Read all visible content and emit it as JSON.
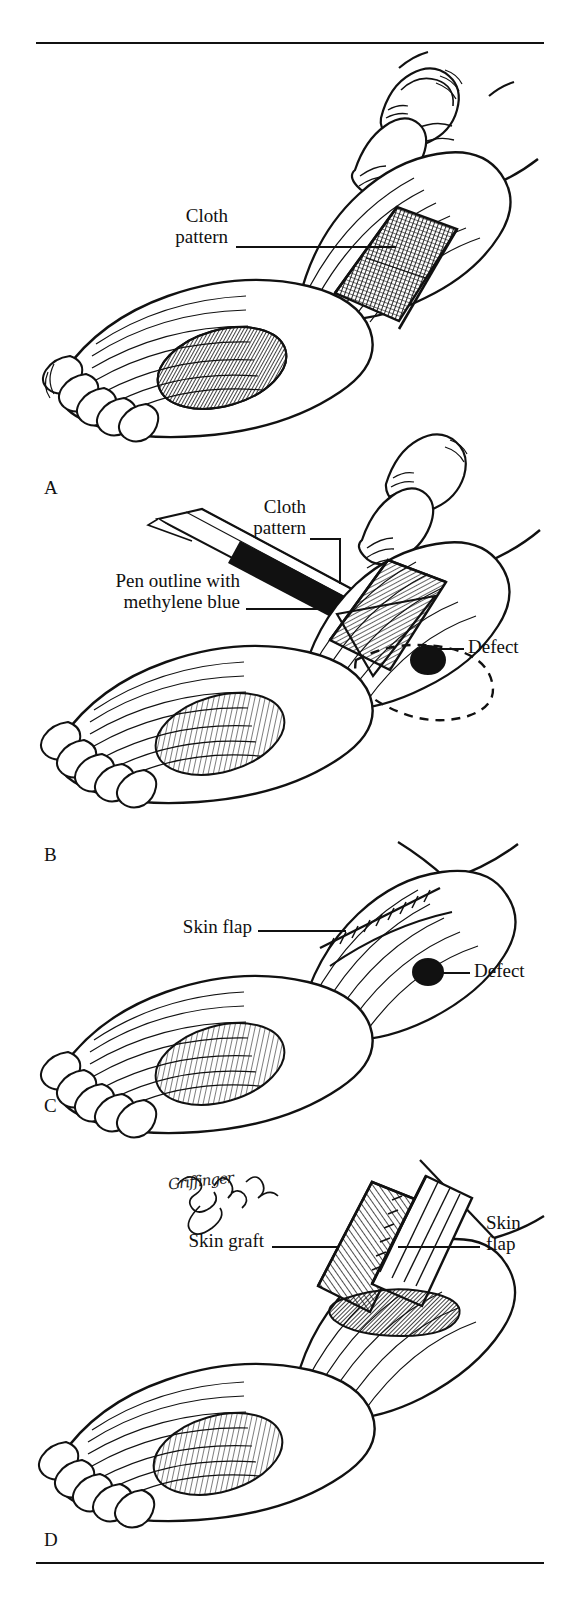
{
  "figure": {
    "type": "surgical-technique-illustration",
    "style": "pen-and-ink cross-hatch line drawing",
    "background_color": "#ffffff",
    "ink_color": "#111111",
    "panel_count": 4
  },
  "rules": {
    "top_label": "top-divider-rule",
    "bottom_label": "bottom-divider-rule"
  },
  "panels": [
    {
      "letter": "A",
      "caption": "",
      "annotations": [
        {
          "text": "Cloth\npattern",
          "align": "right",
          "name": "label-cloth-pattern-a"
        }
      ]
    },
    {
      "letter": "B",
      "caption": "",
      "annotations": [
        {
          "text": "Cloth\npattern",
          "align": "right",
          "name": "label-cloth-pattern-b"
        },
        {
          "text": "Pen outline with\nmethylene blue",
          "align": "right",
          "name": "label-pen-outline"
        },
        {
          "text": "Defect",
          "align": "left",
          "name": "label-defect-b"
        }
      ]
    },
    {
      "letter": "C",
      "caption": "",
      "annotations": [
        {
          "text": "Skin flap",
          "align": "right",
          "name": "label-skin-flap-c"
        },
        {
          "text": "Defect",
          "align": "left",
          "name": "label-defect-c"
        }
      ]
    },
    {
      "letter": "D",
      "caption": "",
      "annotations": [
        {
          "text": "Skin graft",
          "align": "right",
          "name": "label-skin-graft-d"
        },
        {
          "text": "Skin\nflap",
          "align": "left",
          "name": "label-skin-flap-d"
        }
      ]
    }
  ],
  "signature": {
    "text": "Griffinger",
    "name": "artist-signature"
  }
}
